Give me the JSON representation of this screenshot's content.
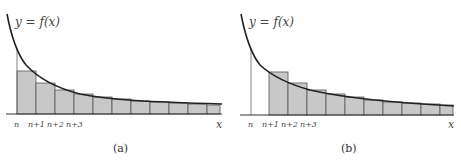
{
  "panels": [
    {
      "id": "a",
      "caption": "(a)",
      "curve_label": "y = f(x)",
      "x_axis_label": "x",
      "tick_labels": [
        "n",
        "n+1",
        "n+2",
        "n+3"
      ],
      "rectangles": "right-endpoint (below curve), starting at n",
      "rectangle_count": 11
    },
    {
      "id": "b",
      "caption": "(b)",
      "curve_label": "y = f(x)",
      "x_axis_label": "x",
      "tick_labels": [
        "n",
        "n+1",
        "n+2",
        "n+3"
      ],
      "rectangles": "left-endpoint (above curve), starting at n+1",
      "rectangle_count": 11
    }
  ],
  "colors": {
    "rect_fill": "#c8c8c8",
    "rect_stroke": "#555555",
    "curve": "#222222",
    "axis": "#333333"
  }
}
